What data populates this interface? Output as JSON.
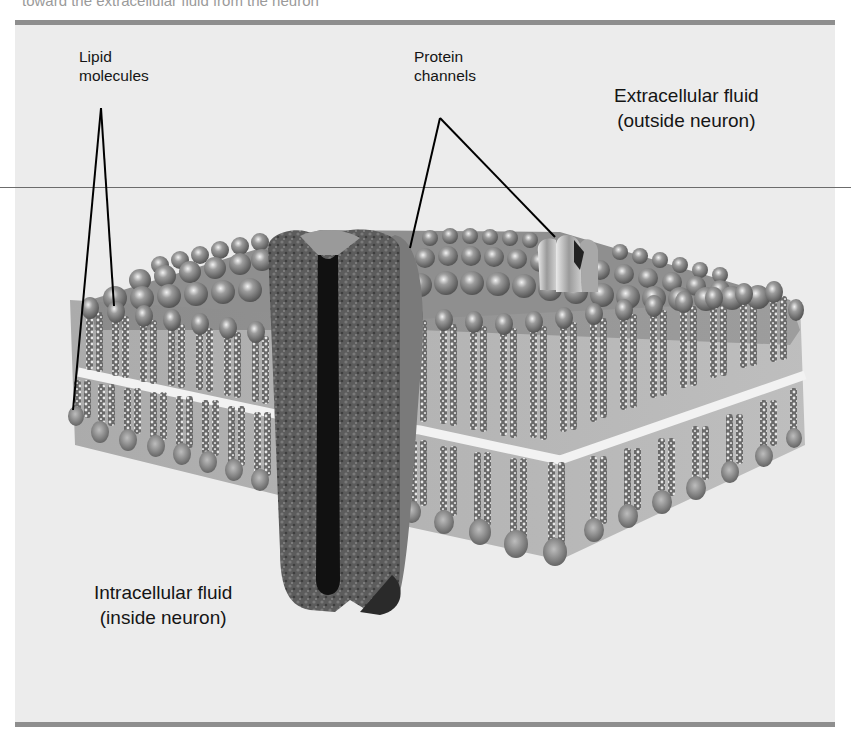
{
  "figure": {
    "cut_top_text": "toward the extracellular fluid from the neuron",
    "labels": {
      "lipid": {
        "line1": "Lipid",
        "line2": "molecules"
      },
      "protein": {
        "line1": "Protein",
        "line2": "channels"
      },
      "extracellular": {
        "line1": "Extracellular fluid",
        "line2": "(outside neuron)"
      },
      "intracellular": {
        "line1": "Intracellular fluid",
        "line2": "(inside neuron)"
      }
    },
    "components": [
      "lipid-bilayer",
      "large-protein-channel",
      "small-protein-channel"
    ],
    "colors": {
      "panel_bg": "#ececec",
      "bar": "#8e8e8e",
      "lipid_head": "#8a8a8a",
      "channel": "#5a5a5a",
      "pore": "#111111"
    }
  }
}
